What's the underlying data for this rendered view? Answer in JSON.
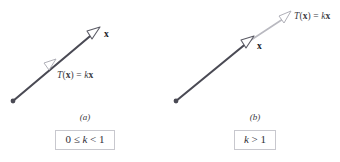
{
  "figure": {
    "colors": {
      "vector_dark": "#4a4a54",
      "vector_light": "#b9b9c0",
      "arrowhead_fill": "#ffffff",
      "box_border": "#c8c8ce",
      "text": "#2e2e36",
      "background": "#ffffff"
    },
    "panels": [
      {
        "id": "a",
        "caption": "(a)",
        "condition": "0 ≤ k < 1",
        "condition_parts": {
          "lhs": "0 ≤ ",
          "var": "k",
          "rhs": " < 1"
        },
        "vector_label": "x",
        "transform_label": {
          "fn": "T",
          "open": "(",
          "arg": "x",
          "close": ")",
          "eq": " = ",
          "scalar": "k",
          "vec": "x"
        },
        "transform_label_text": "T(x) = kx",
        "origin": {
          "x": 13,
          "y": 101
        },
        "x_tip": {
          "x": 98,
          "y": 30
        },
        "t_tip": {
          "x": 53,
          "y": 63
        }
      },
      {
        "id": "b",
        "caption": "(b)",
        "condition": "k > 1",
        "condition_parts": {
          "lhs": "",
          "var": "k",
          "rhs": " > 1"
        },
        "vector_label": "x",
        "transform_label": {
          "fn": "T",
          "open": "(",
          "arg": "x",
          "close": ")",
          "eq": " = ",
          "scalar": "k",
          "vec": "x"
        },
        "transform_label_text": "T(x) = kx",
        "origin": {
          "x": 6,
          "y": 101
        },
        "x_tip": {
          "x": 80,
          "y": 40
        },
        "t_tip": {
          "x": 118,
          "y": 15
        }
      }
    ]
  }
}
